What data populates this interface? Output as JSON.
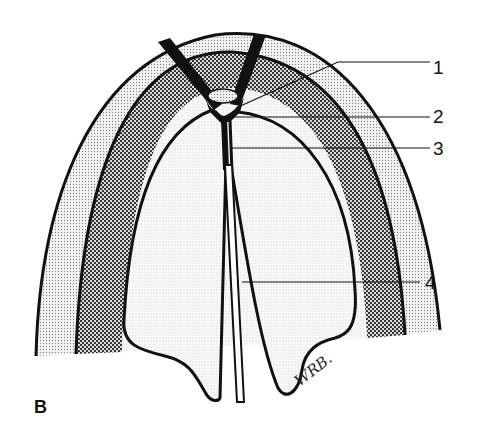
{
  "figure": {
    "panel_letter": "B",
    "signature": "WRB.",
    "labels": [
      {
        "id": "1",
        "text": "1",
        "x": 432,
        "y": 58
      },
      {
        "id": "2",
        "text": "2",
        "x": 432,
        "y": 106
      },
      {
        "id": "3",
        "text": "3",
        "x": 432,
        "y": 140
      },
      {
        "id": "4",
        "text": "4",
        "x": 424,
        "y": 273
      }
    ],
    "colors": {
      "outline": "#111111",
      "outer_band": "#dcdcdc",
      "middle_band": "#a9a9a9",
      "inner_region": "#f0f0f0",
      "small_gland": "#9a9a9a"
    }
  }
}
